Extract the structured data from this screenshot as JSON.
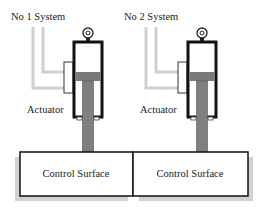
{
  "diagram": {
    "type": "dual-actuator-control-surface",
    "colors": {
      "outline": "#111111",
      "piston": "#7a7a7a",
      "rod": "#7f7f7f",
      "pipe": "#cfcfcf",
      "shadow": "#d2d2d2",
      "background": "#ffffff"
    },
    "systems": [
      {
        "label": "No 1 System",
        "actuator_label": "Actuator"
      },
      {
        "label": "No 2 System",
        "actuator_label": "Actuator"
      }
    ],
    "surfaces": [
      {
        "label": "Control Surface"
      },
      {
        "label": "Control Surface"
      }
    ]
  }
}
